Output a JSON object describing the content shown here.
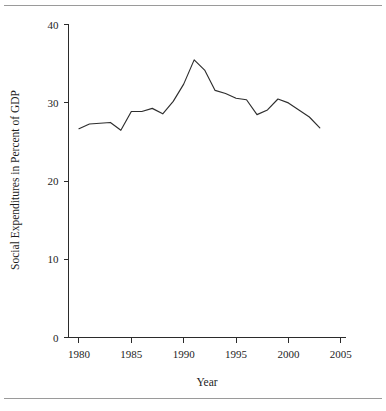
{
  "figure": {
    "background_color": "#ffffff",
    "line_color": "#2e2e2e",
    "axis_color": "#2b2b2b",
    "rule_color": "#9a9a9a"
  },
  "chart_data": {
    "type": "line",
    "title": "",
    "subtitle": "",
    "xlabel": "Year",
    "ylabel": "Social Expenditures in Percent of GDP",
    "xlim": [
      1979.0,
      2005.5
    ],
    "ylim": [
      0,
      41
    ],
    "xticks": [
      1980,
      1985,
      1990,
      1995,
      2000,
      2005
    ],
    "xtick_labels": [
      "1980",
      "1985",
      "1990",
      "1995",
      "2000",
      "2005"
    ],
    "yticks": [
      0,
      10,
      20,
      30,
      40
    ],
    "ytick_labels": [
      "0",
      "10",
      "20",
      "30",
      "40"
    ],
    "grid": false,
    "legend": false,
    "legend_position": "none",
    "series": [
      {
        "name": "Social Expenditures in Percent of GDP",
        "x": [
          1980,
          1981,
          1982,
          1983,
          1984,
          1985,
          1986,
          1987,
          1988,
          1989,
          1990,
          1991,
          1992,
          1993,
          1994,
          1995,
          1996,
          1997,
          1998,
          1999,
          2000,
          2001,
          2002,
          2003
        ],
        "values": [
          26.7,
          27.3,
          27.4,
          27.5,
          26.5,
          28.9,
          28.9,
          29.3,
          28.6,
          30.2,
          32.4,
          35.5,
          34.2,
          31.6,
          31.2,
          30.6,
          30.4,
          28.5,
          29.1,
          30.5,
          30.0,
          29.1,
          28.2,
          26.8
        ]
      }
    ]
  }
}
